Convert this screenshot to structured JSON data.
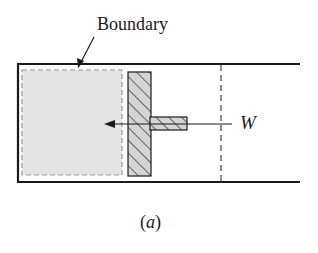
{
  "diagram": {
    "labels": {
      "boundary": "Boundary",
      "work": "W",
      "caption_open": "(",
      "caption_letter": "a",
      "caption_close": ")"
    },
    "elements": [
      "cylinder",
      "gas-region",
      "system-boundary",
      "piston",
      "piston-rod",
      "work-arrow",
      "dashed-position-line"
    ],
    "colors": {
      "stroke": "#1a1a1a",
      "gas_fill": "#e4e4e4",
      "boundary_dash": "#9a9a9a",
      "piston_fill": "#d4d4d4"
    }
  }
}
